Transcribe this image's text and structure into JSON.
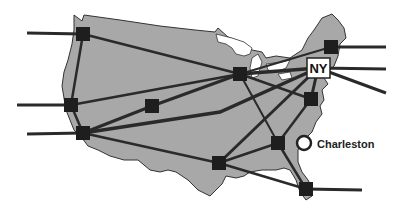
{
  "diagram": {
    "type": "network-map",
    "region": "continental-united-states",
    "colors": {
      "land": "#a8a8a8",
      "land_outline": "#333333",
      "link": "#2a2a2a",
      "node": "#1e1e1e",
      "label_box_fill": "#ffffff",
      "label_box_stroke": "#222222",
      "highlight_circle_fill": "#ffffff"
    },
    "labels": {
      "ny": "NY",
      "charleston": "Charleston"
    },
    "nodes": [
      {
        "id": "nw",
        "x": 83,
        "y": 34
      },
      {
        "id": "w",
        "x": 71,
        "y": 105
      },
      {
        "id": "sw",
        "x": 83,
        "y": 133
      },
      {
        "id": "mountain",
        "x": 152,
        "y": 106
      },
      {
        "id": "midwest",
        "x": 240,
        "y": 74
      },
      {
        "id": "northeast",
        "x": 331,
        "y": 47
      },
      {
        "id": "ny",
        "x": 318,
        "y": 68
      },
      {
        "id": "midatlantic",
        "x": 311,
        "y": 99
      },
      {
        "id": "southeast",
        "x": 278,
        "y": 143
      },
      {
        "id": "south",
        "x": 219,
        "y": 163
      },
      {
        "id": "florida",
        "x": 306,
        "y": 189
      }
    ],
    "highlight": {
      "id": "charleston",
      "x": 305,
      "y": 143
    }
  }
}
